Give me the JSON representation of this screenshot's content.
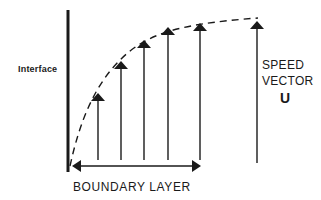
{
  "diagram": {
    "type": "boundary-layer-velocity-profile",
    "labels": {
      "interface": "Interface",
      "speed_vector_line1": "SPEED",
      "speed_vector_line2": "VECTOR",
      "speed_symbol": "U",
      "boundary_layer": "BOUNDARY LAYER"
    },
    "colors": {
      "ink": "#1a1a1a",
      "background": "#ffffff"
    },
    "interface_line": {
      "x": 68,
      "y1": 10,
      "y2": 172
    },
    "velocity_arrows": [
      {
        "x": 98,
        "tip_y": 95
      },
      {
        "x": 121,
        "tip_y": 62
      },
      {
        "x": 144,
        "tip_y": 41
      },
      {
        "x": 168,
        "tip_y": 28
      },
      {
        "x": 200,
        "tip_y": 24
      }
    ],
    "speed_arrow": {
      "x": 257,
      "tip_y": 22,
      "base_y": 163
    },
    "arrow_base_y": 160,
    "profile_curve": "dashed",
    "boundary_layer_span": {
      "x1": 72,
      "x2": 201,
      "y": 166
    }
  }
}
